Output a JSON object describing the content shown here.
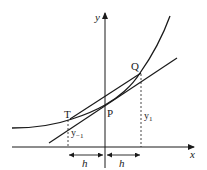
{
  "diagram": {
    "title": "",
    "axes": {
      "x_label": "x",
      "y_label": "y"
    },
    "points": {
      "T": "T",
      "P": "P",
      "Q": "Q"
    },
    "ordinates": {
      "left": "y",
      "left_sub": "−1",
      "right": "y",
      "right_sub": "1"
    },
    "intervals": {
      "left_h": "h",
      "right_h": "h"
    },
    "colors": {
      "stroke": "#1a1a1a",
      "background": "#ffffff"
    }
  }
}
